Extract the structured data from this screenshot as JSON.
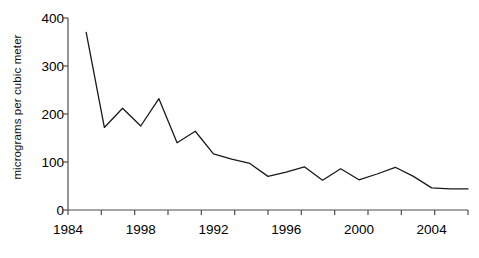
{
  "chart_data": {
    "type": "line",
    "title": "",
    "subtitle": "",
    "xlabel": "",
    "ylabel": "micrograms per cubic meter",
    "xlim": [
      0,
      22
    ],
    "ylim": [
      0,
      400
    ],
    "grid": false,
    "legend": null,
    "legend_position": "none",
    "line_color": "#1a1a1a",
    "axis_color": "#4d4d4d",
    "x_tick_labels": [
      "1984",
      "1998",
      "1992",
      "1996",
      "2000",
      "2004"
    ],
    "x_tick_label_indices": [
      0,
      4,
      8,
      12,
      16,
      20
    ],
    "x_minor_tick_count": 12,
    "y_tick_labels": [
      "0",
      "100",
      "200",
      "300",
      "400"
    ],
    "y_tick_values": [
      0,
      100,
      200,
      300,
      400
    ],
    "x": [
      1,
      2,
      3,
      4,
      5,
      6,
      7,
      8,
      9,
      10,
      11,
      12,
      13,
      14,
      15,
      16,
      17,
      18,
      19,
      20,
      21,
      22
    ],
    "values": [
      370,
      172,
      212,
      175,
      232,
      140,
      164,
      117,
      106,
      97,
      70,
      79,
      90,
      62,
      86,
      63,
      75,
      89,
      70,
      46,
      44,
      44
    ],
    "series": [
      {
        "name": "particulate concentration",
        "values": [
          370,
          172,
          212,
          175,
          232,
          140,
          164,
          117,
          106,
          97,
          70,
          79,
          90,
          62,
          86,
          63,
          75,
          89,
          70,
          46,
          44,
          44
        ]
      }
    ],
    "annotations": []
  }
}
